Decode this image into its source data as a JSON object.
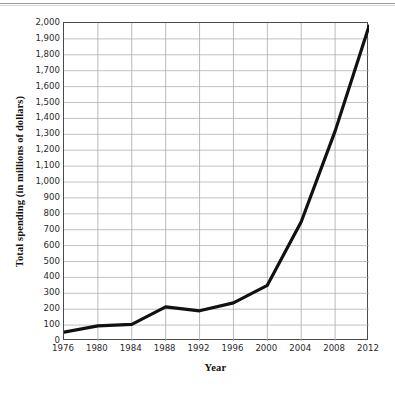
{
  "chart_data": {
    "type": "line",
    "title": "",
    "xlabel": "Year",
    "ylabel": "Total spending (in millions of dollars)",
    "x": [
      1976,
      1980,
      1984,
      1988,
      1992,
      1996,
      2000,
      2004,
      2008,
      2012
    ],
    "xtick_labels": [
      "1976",
      "1980",
      "1984",
      "1988",
      "1992",
      "1996",
      "2000",
      "2004",
      "2008",
      "2012"
    ],
    "values": [
      55,
      95,
      105,
      215,
      190,
      240,
      350,
      750,
      1320,
      1980
    ],
    "ytick_labels": [
      "0",
      "100",
      "200",
      "300",
      "400",
      "500",
      "600",
      "700",
      "800",
      "900",
      "1,000",
      "1,100",
      "1,200",
      "1,300",
      "1,400",
      "1,500",
      "1,600",
      "1,700",
      "1,800",
      "1,900",
      "2,000"
    ],
    "ytick_values": [
      0,
      100,
      200,
      300,
      400,
      500,
      600,
      700,
      800,
      900,
      1000,
      1100,
      1200,
      1300,
      1400,
      1500,
      1600,
      1700,
      1800,
      1900,
      2000
    ],
    "ylim": [
      0,
      2000
    ],
    "xlim": [
      1976,
      2012
    ],
    "grid": true,
    "legend": "none",
    "series": [
      {
        "name": "Total spending",
        "values": [
          55,
          95,
          105,
          215,
          190,
          240,
          350,
          750,
          1320,
          1980
        ]
      }
    ],
    "colors": {
      "line": "#111111",
      "grid": "#a9a9a9",
      "frame": "#4a4a4a",
      "background": "#ffffff",
      "text": "#2a2a2a"
    },
    "line_width": 3.2
  }
}
